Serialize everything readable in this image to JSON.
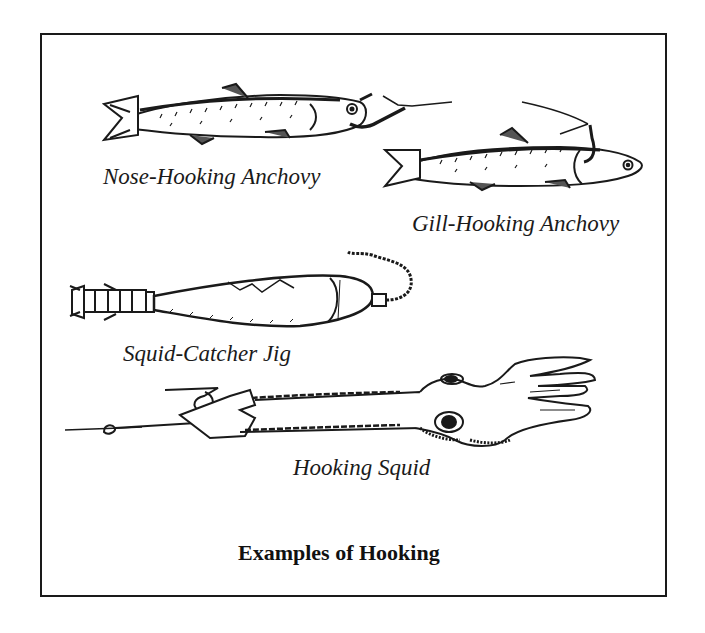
{
  "figure": {
    "caption": "Examples of Hooking",
    "items": [
      {
        "label": "Nose-Hooking Anchovy",
        "icon": "anchovy-nose-hooked"
      },
      {
        "label": "Gill-Hooking Anchovy",
        "icon": "anchovy-gill-hooked"
      },
      {
        "label": "Squid-Catcher Jig",
        "icon": "squid-jig-lure"
      },
      {
        "label": "Hooking Squid",
        "icon": "squid-hooked"
      }
    ]
  },
  "colors": {
    "ink": "#1a1a1a",
    "paper": "#ffffff"
  }
}
